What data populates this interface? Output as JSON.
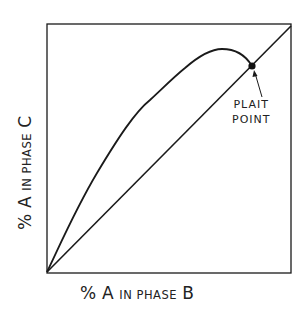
{
  "diagram": {
    "type": "ternary phase-equilibrium distribution curve",
    "x_axis": {
      "label": "% A in phase B",
      "label_parts": {
        "pct": "%",
        "a": "A",
        "rest": "IN PHASE",
        "phase": "B"
      }
    },
    "y_axis": {
      "label": "% A in phase C",
      "label_parts": {
        "pct": "%",
        "a": "A",
        "rest": "IN PHASE",
        "phase": "C"
      }
    },
    "curves": [
      {
        "name": "diagonal",
        "description": "45° reference line y = x from origin to top-right corner"
      },
      {
        "name": "distribution-curve",
        "description": "curve rising above diagonal from origin, peaking, then meeting diagonal at plait point"
      }
    ],
    "annotation": {
      "line1": "PLAIT",
      "line2": "POINT",
      "marker": "filled dot at intersection of curve and diagonal"
    },
    "colors": {
      "line": "#1a1a1a",
      "background": "#ffffff"
    }
  }
}
